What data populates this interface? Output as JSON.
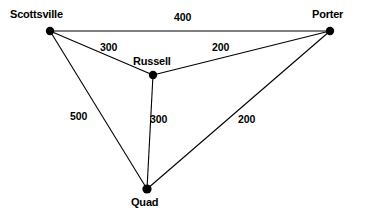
{
  "diagram": {
    "background_color": "#ffffff",
    "stroke_color": "#000000",
    "node_color": "#000000",
    "width": 368,
    "height": 216,
    "nodes": [
      {
        "id": "scottsville",
        "label": "Scottsville",
        "x": 50,
        "y": 31,
        "r": 4.2,
        "label_x": 10,
        "label_y": 8
      },
      {
        "id": "porter",
        "label": "Porter",
        "x": 330,
        "y": 31,
        "r": 4.2,
        "label_x": 312,
        "label_y": 8
      },
      {
        "id": "russell",
        "label": "Russell",
        "x": 153,
        "y": 75,
        "r": 4.2,
        "label_x": 133,
        "label_y": 55
      },
      {
        "id": "quad",
        "label": "Quad",
        "x": 147,
        "y": 189,
        "r": 4.6,
        "label_x": 131,
        "label_y": 196
      }
    ],
    "edges": [
      {
        "id": "scottsville-porter",
        "from": "scottsville",
        "to": "porter",
        "weight": "400",
        "label_x": 174,
        "label_y": 11
      },
      {
        "id": "scottsville-russell",
        "from": "scottsville",
        "to": "russell",
        "weight": "300",
        "label_x": 100,
        "label_y": 41
      },
      {
        "id": "russell-porter",
        "from": "russell",
        "to": "porter",
        "weight": "200",
        "label_x": 212,
        "label_y": 41
      },
      {
        "id": "scottsville-quad",
        "from": "scottsville",
        "to": "quad",
        "weight": "500",
        "label_x": 70,
        "label_y": 110
      },
      {
        "id": "russell-quad",
        "from": "russell",
        "to": "quad",
        "weight": "300",
        "label_x": 150,
        "label_y": 113
      },
      {
        "id": "quad-porter",
        "from": "quad",
        "to": "porter",
        "weight": "200",
        "label_x": 238,
        "label_y": 113
      }
    ]
  }
}
